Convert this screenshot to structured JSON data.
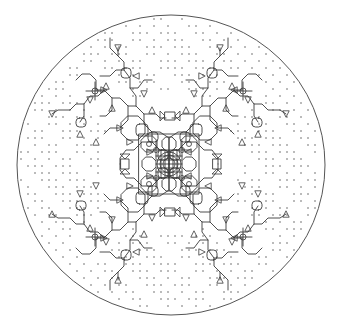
{
  "figure": {
    "title": "",
    "colors": {
      "background": "#ffffff",
      "line": "#3a3a3a",
      "boundary": "#555555",
      "dots": "#444444"
    },
    "boundary": {
      "cx": 171,
      "cy": 165,
      "rx": 154,
      "ry": 150
    },
    "center": {
      "x": 169,
      "y": 164
    },
    "symmetry": "mirror-xy",
    "dot_grid": {
      "spacing": 7,
      "radius": 0.7
    },
    "quadrant_branches": [
      "M169,164 L169,150 L160,150 L152,142 L152,132 L144,124 L144,114 L136,106 L128,106 L120,98 L112,98 L104,90 L96,90",
      "M169,150 L169,138 L160,132 L152,132",
      "M152,142 L142,142 L134,150 L126,150 L120,158 L120,164",
      "M136,106 L136,96 L130,88 L130,78 L124,70 L124,62 L118,56 L118,48",
      "M118,56 L110,48 L110,38",
      "M124,70 L116,70 L110,76 L100,76",
      "M104,90 L98,96 L90,96 L84,104 L76,104 L70,110 L58,110 L52,114",
      "M84,104 L84,116 L80,122",
      "M112,98 L112,110 L106,116 L100,116",
      "M130,88 L138,88 L144,80 L152,80",
      "M144,114 L156,114 L160,118 L166,118",
      "M128,106 L128,120 L120,128 L110,128 L104,134",
      "M96,90 L96,80 L90,74 L82,74 L76,80"
    ],
    "quadrant_rounded_boxes": [
      {
        "x": 121,
        "y": 68,
        "w": 10,
        "h": 10
      },
      {
        "x": 76,
        "y": 118,
        "w": 10,
        "h": 9
      },
      {
        "x": 148,
        "y": 132,
        "w": 10,
        "h": 10
      },
      {
        "x": 136,
        "y": 124,
        "w": 12,
        "h": 12
      },
      {
        "x": 158,
        "y": 150,
        "w": 10,
        "h": 10
      }
    ],
    "quadrant_triangles": [
      {
        "x": 118,
        "y": 48,
        "dir": "down"
      },
      {
        "x": 136,
        "y": 76,
        "dir": "left"
      },
      {
        "x": 104,
        "y": 90,
        "dir": "right"
      },
      {
        "x": 106,
        "y": 86,
        "dir": "up"
      },
      {
        "x": 90,
        "y": 100,
        "dir": "down"
      },
      {
        "x": 52,
        "y": 114,
        "dir": "down"
      },
      {
        "x": 80,
        "y": 134,
        "dir": "up"
      },
      {
        "x": 96,
        "y": 142,
        "dir": "up"
      },
      {
        "x": 112,
        "y": 108,
        "dir": "up"
      },
      {
        "x": 120,
        "y": 128,
        "dir": "right"
      },
      {
        "x": 152,
        "y": 110,
        "dir": "up"
      },
      {
        "x": 144,
        "y": 94,
        "dir": "down"
      },
      {
        "x": 130,
        "y": 142,
        "dir": "right"
      },
      {
        "x": 150,
        "y": 152,
        "dir": "right"
      }
    ],
    "quadrant_crosshairs": [
      {
        "x": 95,
        "y": 91,
        "r": 3
      },
      {
        "x": 156,
        "y": 150,
        "r": 2.5
      }
    ],
    "hourglass_markers": [
      {
        "x": 170,
        "y": 116,
        "orientation": "horizontal"
      },
      {
        "x": 170,
        "y": 212,
        "orientation": "horizontal"
      },
      {
        "x": 125,
        "y": 164,
        "orientation": "vertical"
      },
      {
        "x": 217,
        "y": 164,
        "orientation": "vertical"
      }
    ],
    "core_rings": [
      6,
      9,
      12
    ]
  }
}
